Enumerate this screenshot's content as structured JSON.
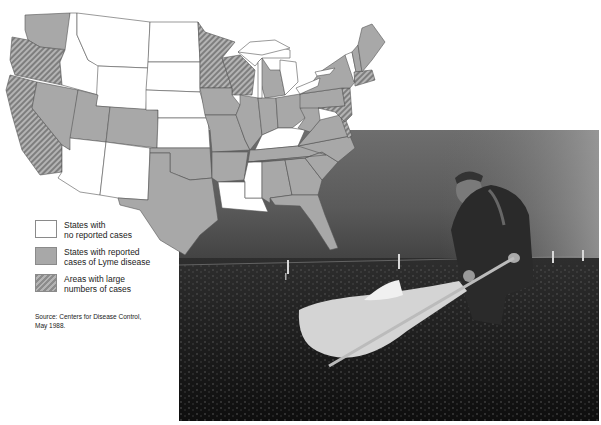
{
  "legend": {
    "items": [
      {
        "key": "none",
        "label_line1": "States with",
        "label_line2": "no reported cases",
        "color": "#ffffff"
      },
      {
        "key": "reported",
        "label_line1": "States with reported",
        "label_line2": "cases of Lyme disease",
        "color": "#a8a8a8"
      },
      {
        "key": "large",
        "label_line1": "Areas with large",
        "label_line2": "numbers of cases",
        "color": "hatched"
      }
    ]
  },
  "source": {
    "line1": "Source: Centers for Disease Control,",
    "line2": "May 1988."
  },
  "map": {
    "title": "Lyme disease cases by US state",
    "states_no_cases": [
      "ID",
      "MT",
      "WY",
      "ND",
      "SD",
      "NE",
      "KS",
      "AZ",
      "NM",
      "KY",
      "MS",
      "LA",
      "VT"
    ],
    "states_reported": [
      "WA",
      "NV",
      "UT",
      "CO",
      "OK",
      "TX",
      "IA",
      "MO",
      "AR",
      "IL",
      "IN",
      "OH",
      "MI",
      "TN",
      "AL",
      "GA",
      "FL",
      "SC",
      "NC",
      "VA",
      "WV",
      "PA",
      "NY",
      "ME",
      "NH"
    ],
    "states_large": [
      "OR",
      "CA",
      "MN",
      "WI",
      "MA",
      "CT",
      "RI",
      "NJ",
      "DE",
      "MD"
    ]
  },
  "photo": {
    "description": "Man in jacket dragging a white cloth across low brush field under cloudy sky, fence posts in background"
  }
}
